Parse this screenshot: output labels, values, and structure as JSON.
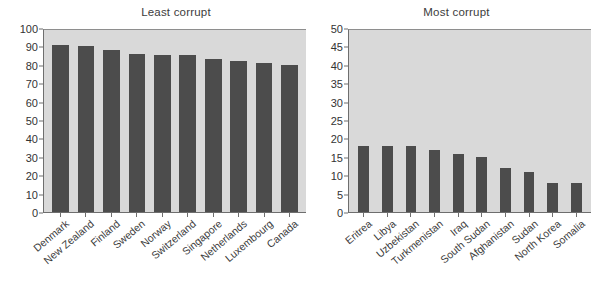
{
  "chart_data": [
    {
      "type": "bar",
      "title": "Least corrupt",
      "xlabel": "",
      "ylabel": "",
      "ylim": [
        0,
        100
      ],
      "yticks": [
        0,
        10,
        20,
        30,
        40,
        50,
        60,
        70,
        80,
        90,
        100
      ],
      "grid": false,
      "legend": "none",
      "bar_color": "#4c4c4c",
      "plot_background": "#d9d9d9",
      "categories": [
        "Denmark",
        "New Zealand",
        "Finland",
        "Sweden",
        "Norway",
        "Switzerland",
        "Singapore",
        "Netherlands",
        "Luxembourg",
        "Canada"
      ],
      "values": [
        92,
        91,
        89,
        87,
        86,
        86,
        84,
        83,
        82,
        81
      ]
    },
    {
      "type": "bar",
      "title": "Most corrupt",
      "xlabel": "",
      "ylabel": "",
      "ylim": [
        0,
        50
      ],
      "yticks": [
        0,
        5,
        10,
        15,
        20,
        25,
        30,
        35,
        40,
        45,
        50
      ],
      "grid": false,
      "legend": "none",
      "bar_color": "#4c4c4c",
      "plot_background": "#d9d9d9",
      "categories": [
        "Eritrea",
        "Libya",
        "Uzbekistan",
        "Turkmenistan",
        "Iraq",
        "South Sudan",
        "Afghanistan",
        "Sudan",
        "North Korea",
        "Somalia"
      ],
      "values": [
        18,
        18,
        18,
        17,
        16,
        15,
        12,
        11,
        8,
        8
      ]
    }
  ]
}
